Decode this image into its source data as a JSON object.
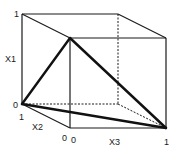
{
  "diagram": {
    "title": "",
    "type": "unit-cube-simplex",
    "axes": {
      "x1": {
        "label": "X1",
        "min_label": "0",
        "max_label": "1"
      },
      "x2": {
        "label": "X2",
        "min_label": "0",
        "max_label": "1"
      },
      "x3": {
        "label": "X3",
        "min_label": "0",
        "max_label": "1"
      }
    },
    "vertices": {
      "back_top_left": [
        22,
        14
      ],
      "back_top_right": [
        118,
        14
      ],
      "front_top_left": [
        70,
        38
      ],
      "front_top_right": [
        166,
        38
      ],
      "back_bottom_left": [
        22,
        104
      ],
      "back_bottom_right": [
        118,
        104
      ],
      "front_bottom_left": [
        70,
        128
      ],
      "front_bottom_right": [
        166,
        128
      ]
    },
    "triangle": {
      "description": "Thick-edged triangle connecting origin corner, top-front-left vertex, and bottom-front-right vertex",
      "points": [
        "back_bottom_left",
        "front_top_left",
        "front_bottom_right"
      ]
    },
    "line_color": "#1a1a1a"
  }
}
